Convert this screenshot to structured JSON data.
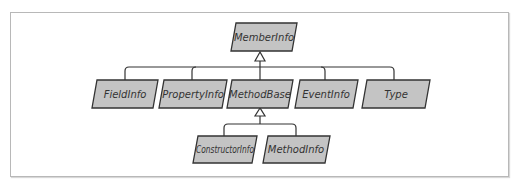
{
  "diagram": {
    "type": "class-hierarchy",
    "root": {
      "id": "memberinfo",
      "label": "MemberInfo"
    },
    "level1": [
      {
        "id": "fieldinfo",
        "label": "FieldInfo"
      },
      {
        "id": "propertyinfo",
        "label": "PropertyInfo"
      },
      {
        "id": "methodbase",
        "label": "MethodBase"
      },
      {
        "id": "eventinfo",
        "label": "EventInfo"
      },
      {
        "id": "type",
        "label": "Type"
      }
    ],
    "level2": [
      {
        "id": "constructorinfo",
        "label": "ConstructorInfo",
        "parent": "methodbase"
      },
      {
        "id": "methodinfo",
        "label": "MethodInfo",
        "parent": "methodbase"
      }
    ],
    "edges": [
      {
        "from": "fieldinfo",
        "to": "memberinfo",
        "kind": "inherits"
      },
      {
        "from": "propertyinfo",
        "to": "memberinfo",
        "kind": "inherits"
      },
      {
        "from": "methodbase",
        "to": "memberinfo",
        "kind": "inherits"
      },
      {
        "from": "eventinfo",
        "to": "memberinfo",
        "kind": "inherits"
      },
      {
        "from": "type",
        "to": "memberinfo",
        "kind": "inherits"
      },
      {
        "from": "constructorinfo",
        "to": "methodbase",
        "kind": "inherits"
      },
      {
        "from": "methodinfo",
        "to": "methodbase",
        "kind": "inherits"
      }
    ],
    "colors": {
      "box_fill": "#c4c4c4",
      "box_stroke": "#333333",
      "line": "#333333",
      "frame": "#b8b8b8"
    }
  }
}
